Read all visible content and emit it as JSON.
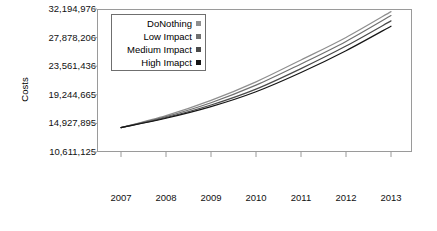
{
  "chart_data": {
    "type": "line",
    "title": "",
    "xlabel": "",
    "ylabel": "Costs",
    "x": [
      2007,
      2008,
      2009,
      2010,
      2011,
      2012,
      2013
    ],
    "xtick_labels": [
      "2007",
      "2008",
      "2009",
      "2010",
      "2011",
      "2012",
      "2013"
    ],
    "ytick_labels": [
      "10,611,125",
      "14,927,895",
      "19,244,665",
      "23,561,436",
      "27,878,206",
      "32,194,976"
    ],
    "ytick_values": [
      10611125,
      14927895,
      19244665,
      23561436,
      27878206,
      32194976
    ],
    "ylim": [
      10611125,
      32194976
    ],
    "xlim": [
      2007,
      2013
    ],
    "grid": false,
    "legend_position": "top-left",
    "series": [
      {
        "name": "DoNothing",
        "color": "#8f8f8f",
        "values": [
          14300000,
          16100000,
          18400000,
          21200000,
          24500000,
          27900000,
          31800000
        ]
      },
      {
        "name": "Low Impact",
        "color": "#707070",
        "values": [
          14300000,
          15950000,
          18050000,
          20700000,
          23900000,
          27300000,
          31200000
        ]
      },
      {
        "name": "Medium Impact",
        "color": "#4a4a4a",
        "values": [
          14300000,
          15800000,
          17700000,
          20100000,
          23200000,
          26600000,
          30400000
        ]
      },
      {
        "name": "High Imapct",
        "color": "#151515",
        "values": [
          14300000,
          15700000,
          17450000,
          19700000,
          22600000,
          25900000,
          29600000
        ]
      }
    ]
  },
  "legend": {
    "items": [
      {
        "label": "DoNothing",
        "color": "#8f8f8f"
      },
      {
        "label": "Low Impact",
        "color": "#707070"
      },
      {
        "label": "Medium Impact",
        "color": "#4a4a4a"
      },
      {
        "label": "High Imapct",
        "color": "#151515"
      }
    ]
  },
  "axes": {
    "y_title": "Costs"
  }
}
